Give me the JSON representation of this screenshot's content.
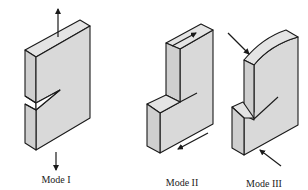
{
  "figure": {
    "colors": {
      "face_fill": "#d9d9d9",
      "top_fill": "#e4e4e4",
      "side_fill": "#cfcfcf",
      "stroke": "#1a1a1a",
      "background": "#ffffff"
    },
    "panels": [
      {
        "id": "mode-1",
        "label": "Mode I",
        "loading": "opening (tensile, normal to crack plane)"
      },
      {
        "id": "mode-2",
        "label": "Mode II",
        "loading": "sliding (in-plane shear)"
      },
      {
        "id": "mode-3",
        "label": "Mode III",
        "loading": "tearing (out-of-plane shear)"
      }
    ]
  }
}
